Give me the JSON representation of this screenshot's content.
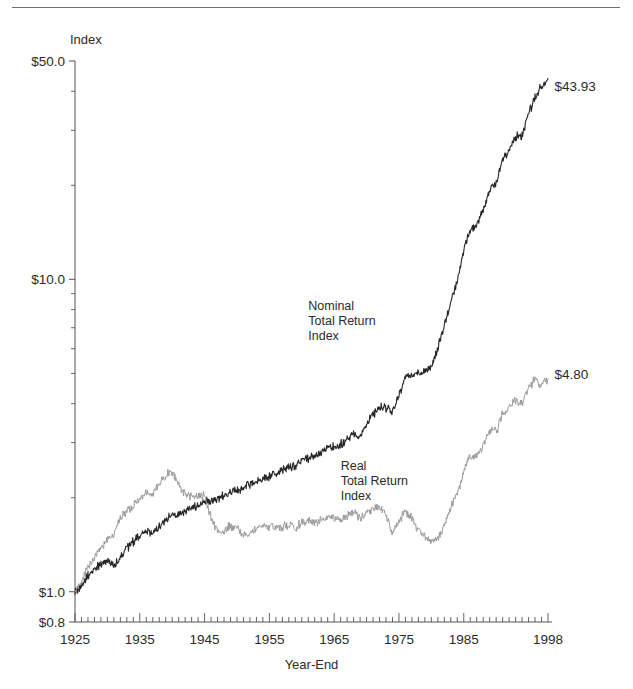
{
  "figure": {
    "has_top_rule": true,
    "background_color": "#ffffff"
  },
  "chart_data": {
    "type": "line",
    "title": "",
    "subtitle": "",
    "xlabel": "Year-End",
    "ylabel": "Index",
    "yscale": "log",
    "ylim": [
      0.8,
      50.0
    ],
    "xlim": [
      1925,
      1998
    ],
    "grid": false,
    "legend_position": "inline-annotations",
    "y_tick_labels": [
      "$50.0",
      "$10.0",
      "$1.0",
      "$0.8"
    ],
    "y_tick_values": [
      50.0,
      10.0,
      1.0,
      0.8
    ],
    "x_tick_labels": [
      "1925",
      "1935",
      "1945",
      "1955",
      "1965",
      "1975",
      "1985",
      "1998"
    ],
    "x_tick_values": [
      1925,
      1935,
      1945,
      1955,
      1965,
      1975,
      1985,
      1998
    ],
    "x_minor_tick_interval": 1,
    "annotations": [
      {
        "name": "nominal-series-annotation",
        "text": "Nominal\nTotal Return\nIndex",
        "x": 1961,
        "y": 8.0
      },
      {
        "name": "real-series-annotation",
        "text": "Real\nTotal Return\nIndex",
        "x": 1966,
        "y": 2.45
      },
      {
        "name": "nominal-endpoint-value",
        "text": "$43.93",
        "x": 1999,
        "y": 40.0
      },
      {
        "name": "real-endpoint-value",
        "text": "$4.80",
        "x": 1999,
        "y": 4.8
      }
    ],
    "series": [
      {
        "name": "Nominal Total Return Index",
        "color": "#262626",
        "width": 1.1,
        "final_value": 43.93,
        "start_value": 1.0,
        "x": [
          1925,
          1926,
          1927,
          1928,
          1929,
          1930,
          1931,
          1932,
          1933,
          1934,
          1935,
          1936,
          1937,
          1938,
          1939,
          1940,
          1941,
          1942,
          1943,
          1944,
          1945,
          1946,
          1947,
          1948,
          1949,
          1950,
          1951,
          1952,
          1953,
          1954,
          1955,
          1956,
          1957,
          1958,
          1959,
          1960,
          1961,
          1962,
          1963,
          1964,
          1965,
          1966,
          1967,
          1968,
          1969,
          1970,
          1971,
          1972,
          1973,
          1974,
          1975,
          1976,
          1977,
          1978,
          1979,
          1980,
          1981,
          1982,
          1983,
          1984,
          1985,
          1986,
          1987,
          1988,
          1989,
          1990,
          1991,
          1992,
          1993,
          1994,
          1995,
          1996,
          1997,
          1998
        ],
        "values": [
          1.0,
          1.05,
          1.13,
          1.18,
          1.22,
          1.27,
          1.22,
          1.29,
          1.38,
          1.44,
          1.5,
          1.57,
          1.53,
          1.62,
          1.7,
          1.77,
          1.76,
          1.8,
          1.86,
          1.91,
          1.95,
          1.96,
          1.99,
          2.03,
          2.09,
          2.12,
          2.15,
          2.2,
          2.26,
          2.32,
          2.34,
          2.36,
          2.45,
          2.49,
          2.51,
          2.62,
          2.68,
          2.73,
          2.81,
          2.88,
          2.93,
          2.96,
          3.07,
          3.2,
          3.17,
          3.45,
          3.7,
          3.9,
          3.88,
          3.76,
          4.24,
          4.9,
          4.96,
          4.97,
          5.04,
          5.25,
          6.0,
          7.15,
          8.45,
          9.95,
          12.3,
          14.4,
          14.9,
          16.7,
          19.4,
          20.2,
          24.2,
          26.1,
          28.6,
          28.9,
          34.1,
          38.0,
          41.5,
          43.93
        ]
      },
      {
        "name": "Real Total Return Index",
        "color": "#9a9a9a",
        "width": 1.0,
        "final_value": 4.8,
        "start_value": 1.0,
        "x": [
          1925,
          1926,
          1927,
          1928,
          1929,
          1930,
          1931,
          1932,
          1933,
          1934,
          1935,
          1936,
          1937,
          1938,
          1939,
          1940,
          1941,
          1942,
          1943,
          1944,
          1945,
          1946,
          1947,
          1948,
          1949,
          1950,
          1951,
          1952,
          1953,
          1954,
          1955,
          1956,
          1957,
          1958,
          1959,
          1960,
          1961,
          1962,
          1963,
          1964,
          1965,
          1966,
          1967,
          1968,
          1969,
          1970,
          1971,
          1972,
          1973,
          1974,
          1975,
          1976,
          1977,
          1978,
          1979,
          1980,
          1981,
          1982,
          1983,
          1984,
          1985,
          1986,
          1987,
          1988,
          1989,
          1990,
          1991,
          1992,
          1993,
          1994,
          1995,
          1996,
          1997,
          1998
        ],
        "values": [
          1.0,
          1.08,
          1.2,
          1.29,
          1.36,
          1.48,
          1.52,
          1.72,
          1.82,
          1.88,
          1.98,
          2.08,
          2.04,
          2.24,
          2.36,
          2.41,
          2.2,
          2.04,
          2.0,
          2.02,
          2.03,
          1.72,
          1.56,
          1.58,
          1.63,
          1.58,
          1.52,
          1.56,
          1.6,
          1.64,
          1.62,
          1.6,
          1.62,
          1.63,
          1.6,
          1.66,
          1.68,
          1.66,
          1.7,
          1.72,
          1.73,
          1.7,
          1.75,
          1.8,
          1.72,
          1.78,
          1.84,
          1.88,
          1.76,
          1.55,
          1.68,
          1.82,
          1.7,
          1.58,
          1.5,
          1.45,
          1.48,
          1.62,
          1.86,
          2.04,
          2.42,
          2.72,
          2.7,
          2.92,
          3.28,
          3.24,
          3.72,
          3.9,
          4.12,
          4.02,
          4.5,
          4.8,
          4.6,
          4.8
        ]
      }
    ]
  }
}
